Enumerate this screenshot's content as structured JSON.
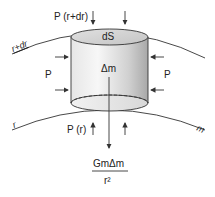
{
  "diagram": {
    "labels": {
      "top_pressure": "P (r+dr)",
      "bottom_pressure": "P (r)",
      "side_pressure_left": "P",
      "side_pressure_right": "P",
      "top_surface": "dS",
      "mass_element": "Δm",
      "outer_shell": "r+dr",
      "inner_shell": "r",
      "enclosed_mass": "m",
      "gravity_numerator": "GmΔm",
      "gravity_denominator": "r²"
    },
    "colors": {
      "line": "#333333",
      "cylinder_light": "#f2f2f2",
      "cylinder_dark": "#a8a8a8",
      "background": "#ffffff"
    }
  }
}
